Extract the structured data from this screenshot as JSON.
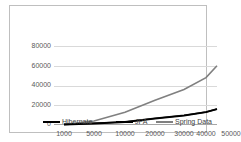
{
  "chart_data": {
    "type": "line",
    "title": "",
    "subtitle": "",
    "xlabel": "",
    "ylabel": "",
    "categories": [
      "1000",
      "5000",
      "10000",
      "20000",
      "30000",
      "40000",
      "50000"
    ],
    "x_tick_labels": [
      "1000",
      "5000",
      "10000",
      "20000",
      "30000",
      "40000",
      "50000"
    ],
    "y_tick_labels": [
      "0",
      "20000",
      "40000",
      "60000",
      "80000"
    ],
    "ylim": [
      0,
      80000
    ],
    "y_ticks": [
      0,
      20000,
      40000,
      60000,
      80000
    ],
    "grid": true,
    "legend_position": "bottom",
    "series": [
      {
        "name": "Hibernate",
        "color": "#000000",
        "values": [
          500,
          1500,
          3000,
          6500,
          9500,
          13000,
          16000
        ]
      },
      {
        "name": "JPA",
        "color": "#1a1a1a",
        "values": [
          600,
          1700,
          3200,
          6800,
          9800,
          13200,
          16200
        ]
      },
      {
        "name": "Spring Data",
        "color": "#808080",
        "values": [
          700,
          4000,
          13000,
          25000,
          36000,
          48000,
          60000
        ]
      }
    ]
  },
  "legend": {
    "items": [
      {
        "label": "Hibernate",
        "color": "#000000"
      },
      {
        "label": "JPA",
        "color": "#000000"
      },
      {
        "label": "Spring Data",
        "color": "#808080"
      }
    ]
  },
  "colors": {
    "gridline": "#d9d9d9",
    "axis": "#a6a6a6",
    "border": "#bfbfbf",
    "tick_text": "#595959",
    "legend_text": "#404040",
    "background": "#ffffff"
  }
}
